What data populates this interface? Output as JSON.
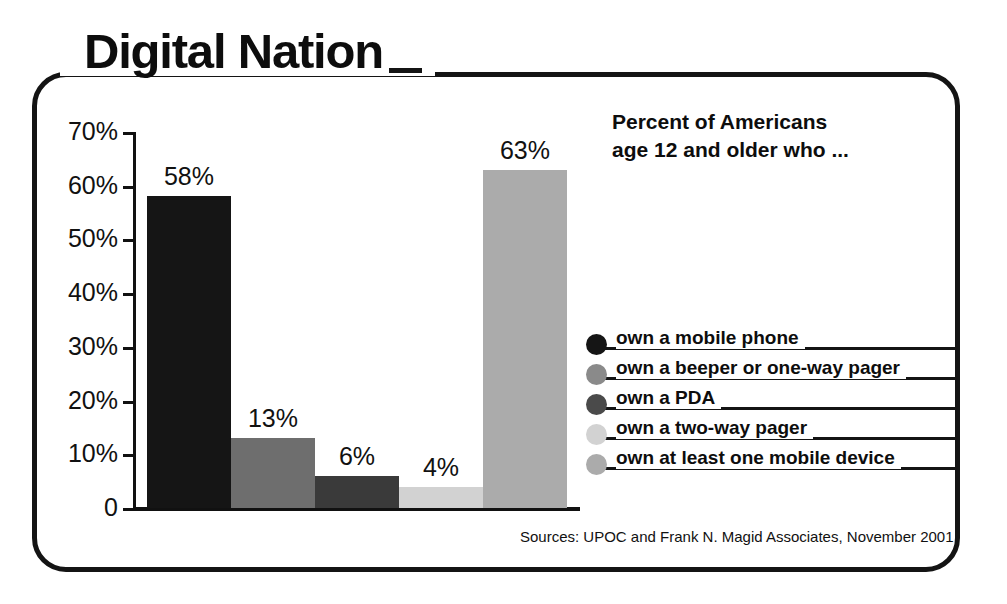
{
  "title": "Digital Nation",
  "headline_line1": "Percent of Americans",
  "headline_line2": "age 12 and older who ...",
  "sources": "Sources: UPOC and Frank N. Magid Associates, November 2001",
  "chart_data": {
    "type": "bar",
    "title": "Digital Nation",
    "subtitle": "Percent of Americans age 12 and older who ...",
    "xlabel": "",
    "ylabel": "",
    "ylim": [
      0,
      70
    ],
    "grid": false,
    "legend_position": "right",
    "categories": [
      "own a mobile phone",
      "own a beeper or one-way pager",
      "own a PDA",
      "own a two-way pager",
      "own at least one mobile device"
    ],
    "values": [
      58,
      13,
      6,
      4,
      63
    ],
    "value_labels": [
      "58%",
      "13%",
      "6%",
      "4%",
      "63%"
    ],
    "bar_colors": [
      "#151515",
      "#6e6e6e",
      "#3a3a3a",
      "#d2d2d2",
      "#ababab"
    ],
    "ytick_values": [
      70,
      60,
      50,
      40,
      30,
      20,
      10,
      0
    ],
    "ytick_labels": [
      "70%",
      "60%",
      "50%",
      "40%",
      "30%",
      "20%",
      "10%",
      "0"
    ],
    "annotations": [
      "Sources: UPOC and Frank N. Magid Associates, November 2001"
    ]
  },
  "legend": [
    {
      "label": "own a mobile phone",
      "color": "#151515"
    },
    {
      "label": "own a beeper or one-way pager",
      "color": "#8a8a8a"
    },
    {
      "label": "own a PDA",
      "color": "#4a4a4a"
    },
    {
      "label": "own a two-way pager",
      "color": "#d2d2d2"
    },
    {
      "label": "own at least one mobile device",
      "color": "#ababab"
    }
  ],
  "colors": {
    "frame": "#141414",
    "text": "#111111"
  }
}
